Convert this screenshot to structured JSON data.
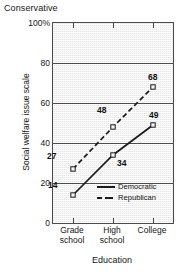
{
  "chart_data": {
    "type": "line",
    "title": "",
    "top_annotation": "Conservative",
    "xlabel": "Education",
    "ylabel": "Social welfare issue scale",
    "categories": [
      "Grade school",
      "High school",
      "College"
    ],
    "category_lines": [
      [
        "Grade",
        "school"
      ],
      [
        "High",
        "school"
      ],
      [
        "College"
      ]
    ],
    "ylim": [
      0,
      100
    ],
    "yticks": [
      "0",
      "20",
      "40",
      "60",
      "80",
      "100%"
    ],
    "ytick_values": [
      0,
      20,
      40,
      60,
      80,
      100
    ],
    "grid": true,
    "legend_position": "inside-bottom-right",
    "series": [
      {
        "name": "Democratic",
        "style": "solid",
        "marker": "open-square",
        "values": [
          14,
          34,
          49
        ],
        "point_labels": [
          "14",
          "34",
          "49"
        ]
      },
      {
        "name": "Republican",
        "style": "dashed",
        "marker": "open-square",
        "values": [
          27,
          48,
          68
        ],
        "point_labels": [
          "27",
          "48",
          "68"
        ]
      }
    ],
    "colors": {
      "plot_background": "#e6e6e6",
      "axis": "#4a4a4a",
      "gridline": "#4d4d4d",
      "line": "#1a1a1a",
      "text": "#161616"
    }
  }
}
